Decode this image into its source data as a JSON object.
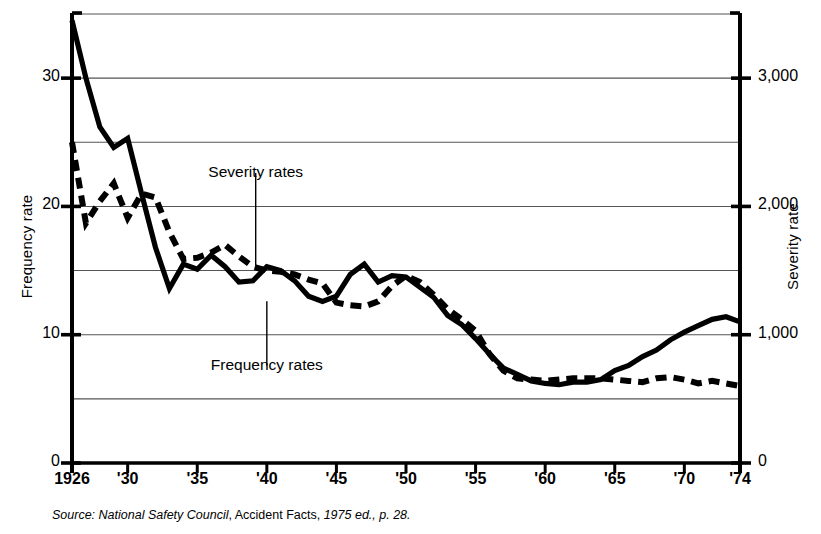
{
  "axes": {
    "left_title": "Frequency rate",
    "right_title": "Severity rate",
    "left_ticks": [
      {
        "label": "0",
        "value": 0
      },
      {
        "label": "10",
        "value": 10
      },
      {
        "label": "20",
        "value": 20
      },
      {
        "label": "30",
        "value": 30
      }
    ],
    "right_ticks": [
      {
        "label": "0",
        "value": 0
      },
      {
        "label": "1,000",
        "value": 1000
      },
      {
        "label": "2,000",
        "value": 2000
      },
      {
        "label": "3,000",
        "value": 3000
      }
    ],
    "gridline_values": [
      5,
      10,
      15,
      20,
      25,
      30,
      35
    ],
    "x_ticks": [
      {
        "label": "1926",
        "year": 1926
      },
      {
        "label": "'30",
        "year": 1930
      },
      {
        "label": "'35",
        "year": 1935
      },
      {
        "label": "'40",
        "year": 1940
      },
      {
        "label": "'45",
        "year": 1945
      },
      {
        "label": "'50",
        "year": 1950
      },
      {
        "label": "'55",
        "year": 1955
      },
      {
        "label": "'60",
        "year": 1960
      },
      {
        "label": "'65",
        "year": 1965
      },
      {
        "label": "'70",
        "year": 1970
      },
      {
        "label": "'74",
        "year": 1974
      }
    ]
  },
  "annotations": [
    {
      "name": "severity-rates-label",
      "text": "Severity rates",
      "year": 1939.2,
      "text_value": 22.6,
      "leader_to_value": 15.4
    },
    {
      "name": "frequency-rates-label",
      "text": "Frequency rates",
      "year": 1940.0,
      "text_value": 7.6,
      "leader_to_value": 12.6
    }
  ],
  "source": {
    "prefix_italic": "Source: National Safety Council",
    "middle_roman": ", Accident Facts, ",
    "suffix_italic": "1975 ed., p. 28."
  },
  "colors": {
    "ink": "#000000",
    "grid": "#555555",
    "background": "#ffffff"
  },
  "chart_data": {
    "type": "line",
    "title": "",
    "xlabel": "",
    "ylabel": "Frequency rate",
    "y2label": "Severity rate",
    "xlim": [
      1926,
      1974
    ],
    "ylim": [
      0,
      35
    ],
    "y2lim": [
      0,
      3500
    ],
    "grid": true,
    "legend": "inline-annotations",
    "x": [
      1926,
      1927,
      1928,
      1929,
      1930,
      1931,
      1932,
      1933,
      1934,
      1935,
      1936,
      1937,
      1938,
      1939,
      1940,
      1941,
      1942,
      1943,
      1944,
      1945,
      1946,
      1947,
      1948,
      1949,
      1950,
      1951,
      1952,
      1953,
      1954,
      1955,
      1956,
      1957,
      1958,
      1959,
      1960,
      1961,
      1962,
      1963,
      1964,
      1965,
      1966,
      1967,
      1968,
      1969,
      1970,
      1971,
      1972,
      1973,
      1974
    ],
    "series": [
      {
        "name": "Frequency rates",
        "style": "solid",
        "axis": "left",
        "values": [
          34.5,
          30.0,
          26.2,
          24.6,
          25.3,
          21.0,
          16.8,
          13.6,
          15.5,
          15.1,
          16.2,
          15.3,
          14.1,
          14.2,
          15.3,
          15.0,
          14.2,
          13.0,
          12.6,
          13.0,
          14.7,
          15.5,
          14.1,
          14.6,
          14.5,
          13.7,
          12.9,
          11.5,
          10.8,
          9.7,
          8.5,
          7.4,
          6.9,
          6.4,
          6.2,
          6.1,
          6.3,
          6.3,
          6.5,
          7.2,
          7.6,
          8.3,
          8.8,
          9.6,
          10.2,
          10.7,
          11.2,
          11.4,
          11.0
        ]
      },
      {
        "name": "Severity rates",
        "style": "dashed",
        "axis": "right",
        "values": [
          2500,
          1870,
          2040,
          2180,
          1910,
          2100,
          2070,
          1800,
          1590,
          1600,
          1640,
          1700,
          1610,
          1530,
          1500,
          1490,
          1470,
          1430,
          1400,
          1250,
          1230,
          1220,
          1260,
          1380,
          1460,
          1410,
          1310,
          1200,
          1120,
          1030,
          850,
          720,
          660,
          650,
          640,
          650,
          660,
          660,
          660,
          650,
          640,
          630,
          660,
          670,
          650,
          620,
          640,
          620,
          600
        ]
      }
    ]
  }
}
